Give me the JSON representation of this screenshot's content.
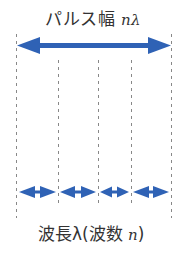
{
  "diagram": {
    "title_label": {
      "text": "パルス幅",
      "math": "nλ"
    },
    "bottom_label": {
      "text_prefix": "波長λ(波数 ",
      "math": "n",
      "text_suffix": ")"
    },
    "colors": {
      "arrow": "#2f62b5",
      "dashed_line": "#888888",
      "text": "#333333"
    },
    "dividers_x": [
      16,
      58,
      98,
      131,
      171
    ],
    "segments_count": 4
  }
}
